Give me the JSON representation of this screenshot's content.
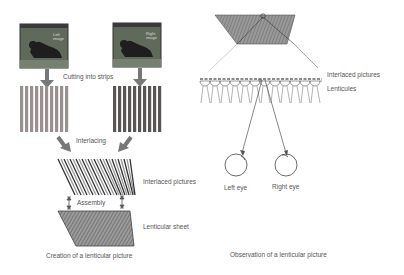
{
  "left_panel": {
    "photo_left_caption": "Left image",
    "photo_right_caption": "Right image",
    "cutting_label": "Cutting into strips",
    "interlacing_label": "Interlacing",
    "interlaced_label": "Interlaced pictures",
    "assembly_label": "Assembly",
    "lenticular_sheet_label": "Lenticular sheet",
    "caption": "Creation of a lenticular picture"
  },
  "right_panel": {
    "interlaced_label": "Interlaced pictures",
    "lenticules_label": "Lenticules",
    "left_eye_label": "Left eye",
    "right_eye_label": "Right eye",
    "caption": "Observation of a lenticular picture"
  },
  "colors": {
    "arrow": "#777777",
    "left_strips": "#9a9090",
    "right_strips": "#5a5555",
    "photo_bg": "#5f6a5a",
    "line": "#555555"
  }
}
